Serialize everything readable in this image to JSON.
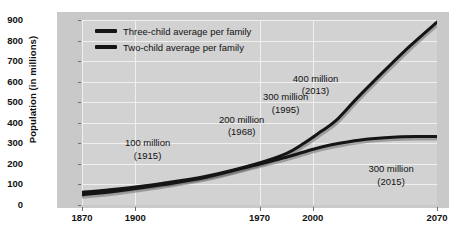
{
  "chart_data": {
    "type": "line",
    "title": "",
    "xlabel": "",
    "ylabel": "Population (in millions)",
    "xlim": [
      1870,
      2070
    ],
    "ylim": [
      0,
      900
    ],
    "grid": true,
    "legend_position": "top-left",
    "xticks": [
      1870,
      1900,
      1970,
      2000,
      2070
    ],
    "xtick_labels": [
      "1870",
      "1900",
      "1970",
      "2000",
      "2070"
    ],
    "yticks": [
      0,
      100,
      200,
      300,
      400,
      500,
      600,
      700,
      800,
      900
    ],
    "ytick_labels": [
      "0",
      "100",
      "200",
      "300",
      "400",
      "500",
      "600",
      "700",
      "800",
      "900"
    ],
    "series": [
      {
        "name": "Three-child average per family",
        "color": "#151515",
        "x": [
          1870,
          1890,
          1915,
          1940,
          1968,
          1985,
          1995,
          2005,
          2013,
          2025,
          2040,
          2055,
          2070
        ],
        "values": [
          62,
          78,
          105,
          140,
          200,
          250,
          300,
          360,
          410,
          520,
          650,
          775,
          890
        ]
      },
      {
        "name": "Two-child average per family",
        "color": "#151515",
        "x": [
          1870,
          1890,
          1915,
          1940,
          1968,
          1985,
          1995,
          2005,
          2015,
          2030,
          2045,
          2060,
          2070
        ],
        "values": [
          50,
          68,
          98,
          135,
          195,
          232,
          258,
          282,
          300,
          320,
          330,
          333,
          333
        ]
      }
    ],
    "annotations": [
      {
        "value_label": "100 million",
        "year_label": "(1915)",
        "x": 1915,
        "y": 105
      },
      {
        "value_label": "200 million",
        "year_label": "(1968)",
        "x": 1968,
        "y": 200
      },
      {
        "value_label": "300 million",
        "year_label": "(1995)",
        "x": 1995,
        "y": 300
      },
      {
        "value_label": "400 million",
        "year_label": "(2013)",
        "x": 2013,
        "y": 410
      },
      {
        "value_label": "300 million",
        "year_label": "(2015)",
        "x": 2015,
        "y": 300
      }
    ]
  },
  "legend": {
    "items": [
      {
        "label": "Three-child average per family"
      },
      {
        "label": "Two-child average per family"
      }
    ]
  }
}
